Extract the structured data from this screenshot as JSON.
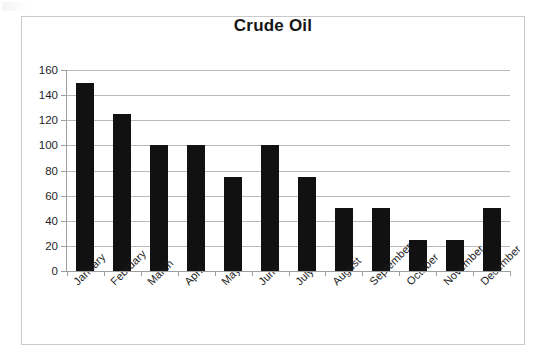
{
  "chart_data": {
    "type": "bar",
    "title": "Crude Oil",
    "xlabel": "",
    "ylabel": "",
    "categories": [
      "January",
      "February",
      "March",
      "April",
      "May",
      "June",
      "July",
      "August",
      "September",
      "October",
      "November",
      "December"
    ],
    "values": [
      150,
      125,
      100,
      100,
      75,
      100,
      75,
      50,
      50,
      25,
      25,
      50
    ],
    "series": [
      {
        "name": "Crude Oil",
        "values": [
          150,
          125,
          100,
          100,
          75,
          100,
          75,
          50,
          50,
          25,
          25,
          50
        ]
      }
    ],
    "ylim": [
      0,
      160
    ],
    "ytick_step": 20,
    "ytick_labels": [
      "160",
      "140",
      "120",
      "100",
      "80",
      "60",
      "40",
      "20",
      "0"
    ],
    "ytick_values": [
      160,
      140,
      120,
      100,
      80,
      60,
      40,
      20,
      0
    ],
    "grid": true,
    "grid_axis": "y",
    "legend": false,
    "legend_position": "none",
    "bar_color": "#111111",
    "gridline_color": "#b9b9b9",
    "axis_color": "#9e9e9e",
    "plot_background": "#ffffff",
    "border_color": "#c9c9c9",
    "xtick_label_rotation": -45
  }
}
